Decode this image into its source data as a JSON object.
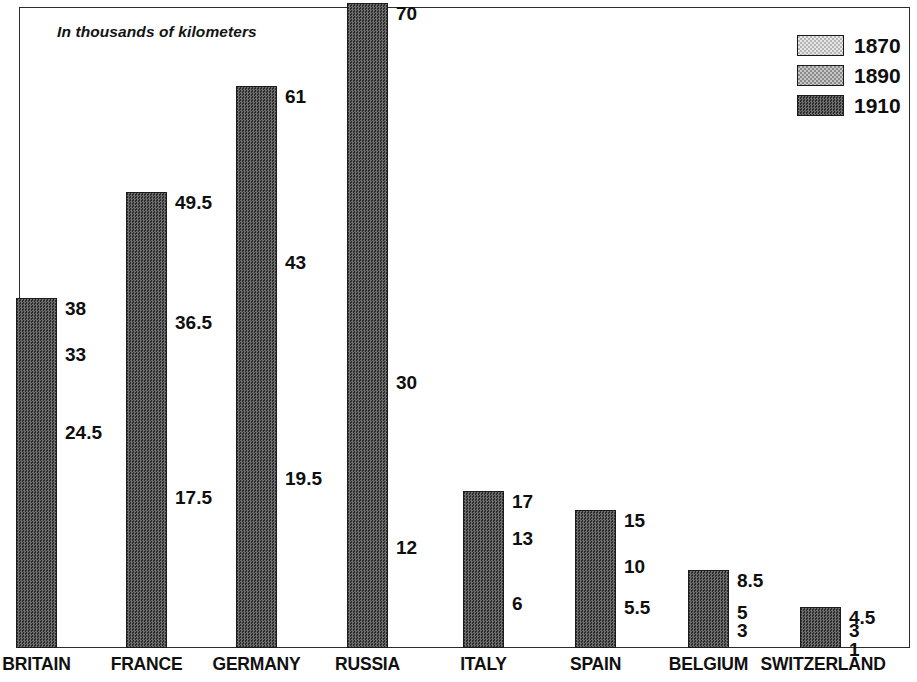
{
  "note": "In thousands of kilometers",
  "legend": {
    "items": [
      {
        "label": "1870",
        "swatch": "light-checker-swatch"
      },
      {
        "label": "1890",
        "swatch": "medium-checker-swatch"
      },
      {
        "label": "1910",
        "swatch": "dark-checker-swatch"
      }
    ]
  },
  "chart_data": {
    "type": "bar",
    "subtype": "stacked-cumulative",
    "title": "",
    "subtitle": "In thousands of kilometers",
    "xlabel": "",
    "ylabel": "",
    "ylim": [
      0,
      70
    ],
    "grid": false,
    "legend_position": "top-right",
    "note": "Values are cumulative totals of railway length; each label marks the top of that year's band.",
    "categories": [
      "BRITAIN",
      "FRANCE",
      "GERMANY",
      "RUSSIA",
      "ITALY",
      "SPAIN",
      "BELGIUM",
      "SWITZERLAND"
    ],
    "series": [
      {
        "name": "1870",
        "values": [
          24.5,
          17.5,
          19.5,
          12,
          6,
          5.5,
          3,
          1
        ]
      },
      {
        "name": "1890",
        "values": [
          33,
          36.5,
          43,
          30,
          13,
          10,
          5,
          3
        ]
      },
      {
        "name": "1910",
        "values": [
          38,
          49.5,
          61,
          70,
          17,
          15,
          8.5,
          4.5
        ]
      }
    ],
    "bars": [
      {
        "category": "BRITAIN",
        "labels": [
          "24.5",
          "33",
          "38"
        ],
        "values": [
          24.5,
          33,
          38
        ]
      },
      {
        "category": "FRANCE",
        "labels": [
          "17.5",
          "36.5",
          "49.5"
        ],
        "values": [
          17.5,
          36.5,
          49.5
        ]
      },
      {
        "category": "GERMANY",
        "labels": [
          "19.5",
          "43",
          "61"
        ],
        "values": [
          19.5,
          43,
          61
        ]
      },
      {
        "category": "RUSSIA",
        "labels": [
          "12",
          "30",
          "70"
        ],
        "values": [
          12,
          30,
          70
        ]
      },
      {
        "category": "ITALY",
        "labels": [
          "6",
          "13",
          "17"
        ],
        "values": [
          6,
          13,
          17
        ]
      },
      {
        "category": "SPAIN",
        "labels": [
          "5.5",
          "10",
          "15"
        ],
        "values": [
          5.5,
          10,
          15
        ]
      },
      {
        "category": "BELGIUM",
        "labels": [
          "3",
          "5",
          "8.5"
        ],
        "values": [
          3,
          5,
          8.5
        ]
      },
      {
        "category": "SWITZERLAND",
        "labels": [
          "1",
          "3",
          "4.5"
        ],
        "values": [
          1,
          3,
          4.5
        ]
      }
    ]
  },
  "colors": {
    "frame": "#2b2b2b",
    "outline": "#1b1b1b",
    "text": "#0f0f0f",
    "fill_1870": "#cfcfcf",
    "fill_1890": "#a8a8a8",
    "fill_1910": "#4f4f4f"
  },
  "layout": {
    "baseline_y": 648,
    "px_per_unit": 9.214,
    "bar_width": 41,
    "bar_left": [
      16,
      126,
      236,
      347,
      463,
      575,
      688,
      800
    ],
    "label_offset_x": 8
  }
}
